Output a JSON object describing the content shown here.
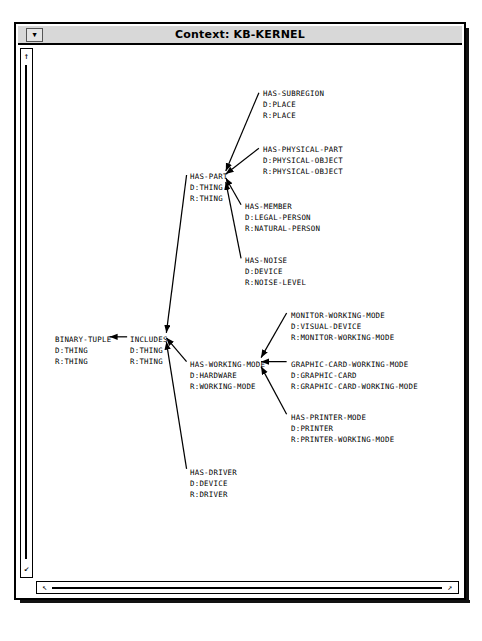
{
  "window": {
    "title": "Context: KB-KERNEL",
    "menu_button_icon": "window-menu-down-arrow-icon",
    "menu_button_glyph": "▼"
  },
  "scrollbars": {
    "vertical": {
      "up_glyph": "↑",
      "down_glyph": "↙",
      "up_icon": "scroll-up-arrow-icon",
      "down_icon": "scroll-down-arrow-icon"
    },
    "horizontal": {
      "left_glyph": "↖",
      "right_glyph": "↗",
      "left_icon": "scroll-left-arrow-icon",
      "right_icon": "scroll-right-arrow-icon"
    }
  },
  "graph": {
    "nodes": [
      {
        "id": "has-subregion",
        "name": "HAS-SUBREGION",
        "domain": "D:PLACE",
        "range": "R:PLACE",
        "x": 228,
        "y": 40
      },
      {
        "id": "has-physical-part",
        "name": "HAS-PHYSICAL-PART",
        "domain": "D:PHYSICAL-OBJECT",
        "range": "R:PHYSICAL-OBJECT",
        "x": 228,
        "y": 96
      },
      {
        "id": "has-part",
        "name": "HAS-PART",
        "domain": "D:THING",
        "range": "R:THING",
        "x": 155,
        "y": 123
      },
      {
        "id": "has-member",
        "name": "HAS-MEMBER",
        "domain": "D:LEGAL-PERSON",
        "range": "R:NATURAL-PERSON",
        "x": 210,
        "y": 153
      },
      {
        "id": "has-noise",
        "name": "HAS-NOISE",
        "domain": "D:DEVICE",
        "range": "R:NOISE-LEVEL",
        "x": 210,
        "y": 207
      },
      {
        "id": "monitor-working-mode",
        "name": "MONITOR-WORKING-MODE",
        "domain": "D:VISUAL-DEVICE",
        "range": "R:MONITOR-WORKING-MODE",
        "x": 256,
        "y": 262
      },
      {
        "id": "binary-tuple",
        "name": "BINARY-TUPLE",
        "domain": "D:THING",
        "range": "R:THING",
        "x": 20,
        "y": 286
      },
      {
        "id": "includes",
        "name": "INCLUDES",
        "domain": "D:THING",
        "range": "R:THING",
        "x": 95,
        "y": 286
      },
      {
        "id": "has-working-mode",
        "name": "HAS-WORKING-MODE",
        "domain": "D:HARDWARE",
        "range": "R:WORKING-MODE",
        "x": 155,
        "y": 311
      },
      {
        "id": "graphic-card-working-mode",
        "name": "GRAPHIC-CARD-WORKING-MODE",
        "domain": "D:GRAPHIC-CARD",
        "range": "R:GRAPHIC-CARD-WORKING-MODE",
        "x": 256,
        "y": 311
      },
      {
        "id": "has-printer-mode",
        "name": "HAS-PRINTER-MODE",
        "domain": "D:PRINTER",
        "range": "R:PRINTER-WORKING-MODE",
        "x": 256,
        "y": 364
      },
      {
        "id": "has-driver",
        "name": "HAS-DRIVER",
        "domain": "D:DEVICE",
        "range": "R:DRIVER",
        "x": 155,
        "y": 419
      }
    ],
    "edges": [
      {
        "from": "has-subregion",
        "to": "has-part"
      },
      {
        "from": "has-physical-part",
        "to": "has-part"
      },
      {
        "from": "has-member",
        "to": "has-part"
      },
      {
        "from": "has-noise",
        "to": "has-part"
      },
      {
        "from": "has-part",
        "to": "includes"
      },
      {
        "from": "has-working-mode",
        "to": "includes"
      },
      {
        "from": "has-driver",
        "to": "includes"
      },
      {
        "from": "includes",
        "to": "binary-tuple"
      },
      {
        "from": "monitor-working-mode",
        "to": "has-working-mode"
      },
      {
        "from": "graphic-card-working-mode",
        "to": "has-working-mode"
      },
      {
        "from": "has-printer-mode",
        "to": "has-working-mode"
      }
    ]
  },
  "colors": {
    "line": "#000000",
    "text": "#000000",
    "titlebar_bg": "#d8d8d8",
    "canvas_bg": "#ffffff"
  }
}
